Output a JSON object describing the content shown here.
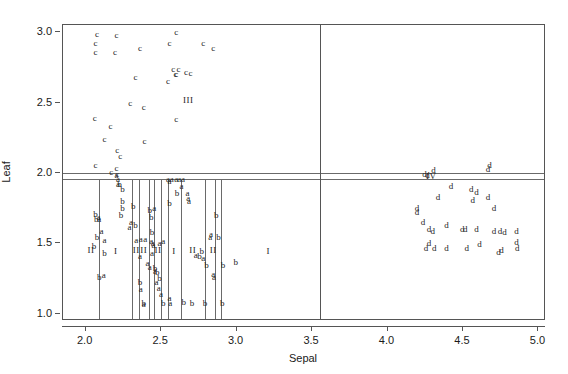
{
  "chart_data": {
    "type": "scatter",
    "title": "",
    "xlabel": "Sepal",
    "ylabel": "Leaf",
    "xlim": [
      1.85,
      5.05
    ],
    "ylim": [
      0.95,
      3.05
    ],
    "xticks": [
      "2.0",
      "2.5",
      "3.0",
      "3.5",
      "4.0",
      "4.5",
      "5.0"
    ],
    "xtick_values": [
      2.0,
      2.5,
      3.0,
      3.5,
      4.0,
      4.5,
      5.0
    ],
    "yticks": [
      "1.0",
      "1.5",
      "2.0",
      "2.5",
      "3.0"
    ],
    "ytick_values": [
      1.0,
      1.5,
      2.0,
      2.5,
      3.0
    ],
    "grid": false,
    "legend": "none",
    "partition_lines": {
      "horizontal_values": [
        2.0,
        1.955
      ],
      "vertical_values": [
        3.555,
        2.09,
        2.305,
        2.355,
        2.42,
        2.455,
        2.5,
        2.545,
        2.63,
        2.79,
        2.86,
        2.9
      ]
    },
    "group_labels": [
      {
        "text": "III",
        "x": 2.68,
        "y": 2.52
      },
      {
        "text": "IV",
        "x": 4.29,
        "y": 1.98
      },
      {
        "text": "I",
        "x": 3.21,
        "y": 1.45
      },
      {
        "text": "I",
        "x": 2.2,
        "y": 1.45
      },
      {
        "text": "I",
        "x": 2.585,
        "y": 1.45
      },
      {
        "text": "II",
        "x": 2.035,
        "y": 1.455
      },
      {
        "text": "II",
        "x": 2.335,
        "y": 1.455
      },
      {
        "text": "II",
        "x": 2.385,
        "y": 1.455
      },
      {
        "text": "II",
        "x": 2.48,
        "y": 1.455
      },
      {
        "text": "II",
        "x": 2.71,
        "y": 1.455
      },
      {
        "text": "II",
        "x": 2.845,
        "y": 1.455
      }
    ],
    "series": [
      {
        "name": "c",
        "label": "c",
        "points": [
          [
            2.075,
            2.985
          ],
          [
            2.065,
            2.925
          ],
          [
            2.065,
            2.855
          ],
          [
            2.205,
            2.98
          ],
          [
            2.195,
            2.855
          ],
          [
            2.36,
            2.885
          ],
          [
            2.33,
            2.68
          ],
          [
            2.6,
            3.0
          ],
          [
            2.555,
            2.925
          ],
          [
            2.58,
            2.74
          ],
          [
            2.615,
            2.735
          ],
          [
            2.6,
            2.705
          ],
          [
            2.595,
            2.7
          ],
          [
            2.545,
            2.655
          ],
          [
            2.665,
            2.72
          ],
          [
            2.695,
            2.71
          ],
          [
            2.78,
            2.925
          ],
          [
            2.845,
            2.885
          ],
          [
            2.295,
            2.495
          ],
          [
            2.385,
            2.47
          ],
          [
            2.6,
            2.385
          ],
          [
            2.06,
            2.39
          ],
          [
            2.165,
            2.335
          ],
          [
            2.125,
            2.24
          ],
          [
            2.39,
            2.23
          ],
          [
            2.21,
            2.165
          ],
          [
            2.23,
            2.12
          ],
          [
            2.065,
            2.055
          ],
          [
            2.17,
            2.005
          ],
          [
            2.205,
            2.035
          ],
          [
            2.21,
            1.99
          ]
        ]
      },
      {
        "name": "a",
        "label": "a",
        "points": [
          [
            2.205,
            1.985
          ],
          [
            2.215,
            1.955
          ],
          [
            2.215,
            1.925
          ],
          [
            2.085,
            1.69
          ],
          [
            2.09,
            1.675
          ],
          [
            2.105,
            1.585
          ],
          [
            2.125,
            1.525
          ],
          [
            2.3,
            1.655
          ],
          [
            2.29,
            1.615
          ],
          [
            2.335,
            1.525
          ],
          [
            2.365,
            1.535
          ],
          [
            2.395,
            1.535
          ],
          [
            2.435,
            1.52
          ],
          [
            2.445,
            1.505
          ],
          [
            2.45,
            1.49
          ],
          [
            2.49,
            1.5
          ],
          [
            2.515,
            1.515
          ],
          [
            2.545,
            1.96
          ],
          [
            2.555,
            1.945
          ],
          [
            2.57,
            1.96
          ],
          [
            2.6,
            1.955
          ],
          [
            2.62,
            1.96
          ],
          [
            2.645,
            1.955
          ],
          [
            2.635,
            1.905
          ],
          [
            2.455,
            1.755
          ],
          [
            2.44,
            1.435
          ],
          [
            2.36,
            1.41
          ],
          [
            2.41,
            1.365
          ],
          [
            2.425,
            1.335
          ],
          [
            2.46,
            1.305
          ],
          [
            2.47,
            1.225
          ],
          [
            2.485,
            1.185
          ],
          [
            2.5,
            1.145
          ],
          [
            2.555,
            1.11
          ],
          [
            2.56,
            1.075
          ],
          [
            2.73,
            1.415
          ],
          [
            2.78,
            1.4
          ],
          [
            2.675,
            1.855
          ],
          [
            2.68,
            1.825
          ],
          [
            2.685,
            1.8
          ],
          [
            2.83,
            1.565
          ],
          [
            2.825,
            1.545
          ],
          [
            2.845,
            1.285
          ],
          [
            2.85,
            1.265
          ],
          [
            2.12,
            1.275
          ],
          [
            2.365,
            1.175
          ],
          [
            2.385,
            1.07
          ]
        ]
      },
      {
        "name": "b",
        "label": "b",
        "points": [
          [
            2.225,
            1.925
          ],
          [
            2.245,
            1.89
          ],
          [
            2.245,
            1.8
          ],
          [
            2.245,
            1.755
          ],
          [
            2.065,
            1.71
          ],
          [
            2.07,
            1.675
          ],
          [
            2.075,
            1.545
          ],
          [
            2.055,
            1.485
          ],
          [
            2.125,
            1.43
          ],
          [
            2.09,
            1.265
          ],
          [
            2.235,
            1.7
          ],
          [
            2.315,
            1.765
          ],
          [
            2.33,
            1.63
          ],
          [
            2.36,
            1.225
          ],
          [
            2.385,
            1.08
          ],
          [
            2.425,
            1.74
          ],
          [
            2.435,
            1.69
          ],
          [
            2.46,
            1.325
          ],
          [
            2.475,
            1.295
          ],
          [
            2.49,
            1.255
          ],
          [
            2.515,
            1.08
          ],
          [
            2.555,
            1.79
          ],
          [
            2.605,
            1.855
          ],
          [
            2.65,
            1.085
          ],
          [
            2.705,
            1.075
          ],
          [
            2.755,
            1.41
          ],
          [
            2.77,
            1.45
          ],
          [
            2.79,
            1.075
          ],
          [
            2.8,
            1.345
          ],
          [
            2.865,
            1.7
          ],
          [
            2.88,
            1.545
          ],
          [
            2.91,
            1.345
          ],
          [
            2.905,
            1.075
          ],
          [
            2.995,
            1.37
          ],
          [
            2.44,
            1.58
          ]
        ]
      },
      {
        "name": "d",
        "label": "d",
        "points": [
          [
            4.245,
            1.99
          ],
          [
            4.265,
            1.985
          ],
          [
            4.305,
            2.02
          ],
          [
            4.42,
            1.905
          ],
          [
            4.335,
            1.83
          ],
          [
            4.195,
            1.755
          ],
          [
            4.195,
            1.72
          ],
          [
            4.235,
            1.655
          ],
          [
            4.275,
            1.605
          ],
          [
            4.3,
            1.585
          ],
          [
            4.275,
            1.5
          ],
          [
            4.255,
            1.47
          ],
          [
            4.31,
            1.47
          ],
          [
            4.39,
            1.465
          ],
          [
            4.39,
            1.63
          ],
          [
            4.555,
            1.885
          ],
          [
            4.59,
            1.865
          ],
          [
            4.565,
            1.81
          ],
          [
            4.665,
            2.03
          ],
          [
            4.675,
            2.055
          ],
          [
            4.665,
            1.83
          ],
          [
            4.705,
            1.755
          ],
          [
            4.59,
            1.605
          ],
          [
            4.515,
            1.6
          ],
          [
            4.705,
            1.59
          ],
          [
            4.745,
            1.585
          ],
          [
            4.775,
            1.58
          ],
          [
            4.61,
            1.495
          ],
          [
            4.525,
            1.465
          ],
          [
            4.735,
            1.44
          ],
          [
            4.755,
            1.455
          ],
          [
            4.855,
            1.585
          ],
          [
            4.86,
            1.465
          ],
          [
            4.855,
            1.51
          ],
          [
            4.495,
            1.6
          ]
        ]
      }
    ]
  }
}
